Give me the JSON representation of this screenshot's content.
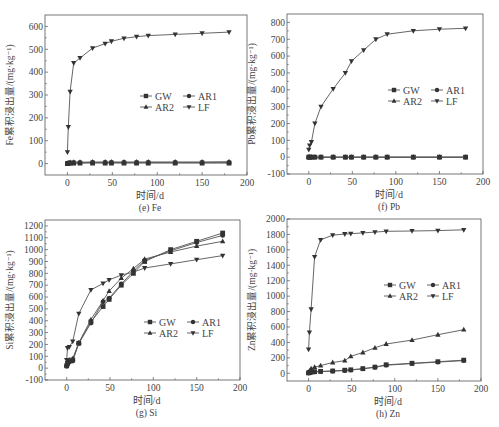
{
  "figure": {
    "caption": ""
  },
  "legend": {
    "entries": [
      {
        "name": "GW",
        "marker": "square"
      },
      {
        "name": "AR1",
        "marker": "circle"
      },
      {
        "name": "AR2",
        "marker": "triangle-up"
      },
      {
        "name": "LF",
        "marker": "triangle-down"
      }
    ]
  },
  "chart_data": [
    {
      "id": "e",
      "type": "line",
      "title": "(e) Fe",
      "xlabel": "时间/d",
      "ylabel": "Fe累积浸出量/(mg·kg⁻¹)",
      "xlim": [
        -25,
        200
      ],
      "ylim": [
        -50,
        650
      ],
      "xticks": [
        0,
        50,
        100,
        150,
        200
      ],
      "yticks": [
        0,
        100,
        200,
        300,
        400,
        500,
        600
      ],
      "frame": {
        "left": 45,
        "top": 15,
        "right": 247,
        "bottom": 175
      },
      "legend_pos": {
        "x": 140,
        "y": 96
      },
      "x": [
        0,
        1,
        3,
        7,
        14,
        28,
        42,
        49,
        63,
        77,
        90,
        120,
        150,
        180
      ],
      "series": [
        {
          "name": "GW",
          "values": [
            0,
            1,
            2,
            2,
            2,
            2,
            2,
            2,
            2,
            2,
            2,
            2,
            2,
            2
          ]
        },
        {
          "name": "AR1",
          "values": [
            0,
            2,
            3,
            4,
            4,
            5,
            5,
            5,
            5,
            5,
            5,
            5,
            5,
            5
          ]
        },
        {
          "name": "AR2",
          "values": [
            1,
            3,
            5,
            6,
            6,
            7,
            7,
            7,
            7,
            7,
            7,
            7,
            7,
            8
          ]
        },
        {
          "name": "LF",
          "values": [
            50,
            160,
            315,
            440,
            462,
            505,
            525,
            535,
            548,
            555,
            560,
            565,
            570,
            575
          ]
        }
      ]
    },
    {
      "id": "f",
      "type": "line",
      "title": "(f) Pb",
      "xlabel": "时间/d",
      "ylabel": "Pb累积浸出量/(mg·kg⁻¹)",
      "xlim": [
        -25,
        200
      ],
      "ylim": [
        -100,
        850
      ],
      "xticks": [
        0,
        50,
        100,
        150,
        200
      ],
      "yticks": [
        -100,
        0,
        100,
        200,
        300,
        400,
        500,
        600,
        700,
        800
      ],
      "frame": {
        "left": 287,
        "top": 14,
        "right": 483,
        "bottom": 174
      },
      "legend_pos": {
        "x": 388,
        "y": 90
      },
      "x": [
        0,
        1,
        3,
        7,
        14,
        28,
        42,
        49,
        63,
        77,
        90,
        120,
        150,
        180
      ],
      "series": [
        {
          "name": "GW",
          "values": [
            0,
            0,
            0,
            0,
            0,
            0,
            0,
            0,
            0,
            0,
            0,
            0,
            0,
            0
          ]
        },
        {
          "name": "AR1",
          "values": [
            0,
            0,
            0,
            0,
            0,
            0,
            0,
            0,
            0,
            0,
            0,
            0,
            0,
            0
          ]
        },
        {
          "name": "AR2",
          "values": [
            0,
            0,
            0,
            0,
            0,
            0,
            0,
            0,
            0,
            0,
            0,
            0,
            0,
            0
          ]
        },
        {
          "name": "LF",
          "values": [
            45,
            70,
            90,
            200,
            300,
            405,
            500,
            570,
            635,
            700,
            730,
            750,
            760,
            765
          ]
        }
      ]
    },
    {
      "id": "g",
      "type": "line",
      "title": "(g) Si",
      "xlabel": "时间/d",
      "ylabel": "Si累积浸出量/(mg·kg⁻¹)",
      "xlim": [
        -25,
        200
      ],
      "ylim": [
        -100,
        1250
      ],
      "xticks": [
        0,
        50,
        100,
        150,
        200
      ],
      "yticks": [
        -100,
        0,
        100,
        200,
        300,
        400,
        500,
        600,
        700,
        800,
        900,
        1000,
        1100,
        1200
      ],
      "frame": {
        "left": 45,
        "top": 220,
        "right": 240,
        "bottom": 380
      },
      "legend_pos": {
        "x": 144,
        "y": 322
      },
      "x": [
        0,
        1,
        3,
        7,
        14,
        28,
        42,
        49,
        63,
        77,
        90,
        120,
        150,
        180
      ],
      "series": [
        {
          "name": "GW",
          "values": [
            20,
            40,
            60,
            70,
            210,
            390,
            520,
            580,
            700,
            800,
            900,
            1000,
            1070,
            1140
          ]
        },
        {
          "name": "AR1",
          "values": [
            15,
            35,
            50,
            60,
            210,
            380,
            560,
            590,
            710,
            820,
            910,
            990,
            1060,
            1120
          ]
        },
        {
          "name": "AR2",
          "values": [
            30,
            50,
            70,
            80,
            215,
            410,
            570,
            650,
            760,
            840,
            920,
            980,
            1030,
            1070
          ]
        },
        {
          "name": "LF",
          "values": [
            70,
            170,
            180,
            225,
            460,
            660,
            715,
            745,
            785,
            810,
            845,
            880,
            915,
            950
          ]
        }
      ]
    },
    {
      "id": "h",
      "type": "line",
      "title": "(h) Zn",
      "xlabel": "时间/d",
      "ylabel": "Zn累积浸出量/(mg·kg⁻¹)",
      "xlim": [
        -25,
        200
      ],
      "ylim": [
        -100,
        2000
      ],
      "xticks": [
        0,
        50,
        100,
        150,
        200
      ],
      "yticks": [
        0,
        200,
        400,
        600,
        800,
        1000,
        1200,
        1400,
        1600,
        1800,
        2000
      ],
      "frame": {
        "left": 287,
        "top": 219,
        "right": 481,
        "bottom": 381
      },
      "legend_pos": {
        "x": 384,
        "y": 285
      },
      "x": [
        0,
        1,
        3,
        7,
        14,
        28,
        42,
        49,
        63,
        77,
        90,
        120,
        150,
        180
      ],
      "series": [
        {
          "name": "GW",
          "values": [
            5,
            10,
            15,
            20,
            25,
            30,
            40,
            45,
            60,
            80,
            110,
            130,
            150,
            170
          ]
        },
        {
          "name": "AR1",
          "values": [
            3,
            8,
            12,
            18,
            22,
            28,
            35,
            42,
            58,
            78,
            105,
            125,
            145,
            165
          ]
        },
        {
          "name": "AR2",
          "values": [
            10,
            30,
            60,
            80,
            100,
            140,
            165,
            220,
            270,
            330,
            380,
            430,
            500,
            565
          ]
        },
        {
          "name": "LF",
          "values": [
            310,
            530,
            830,
            1510,
            1730,
            1790,
            1805,
            1810,
            1820,
            1830,
            1840,
            1845,
            1850,
            1860
          ]
        }
      ]
    }
  ]
}
